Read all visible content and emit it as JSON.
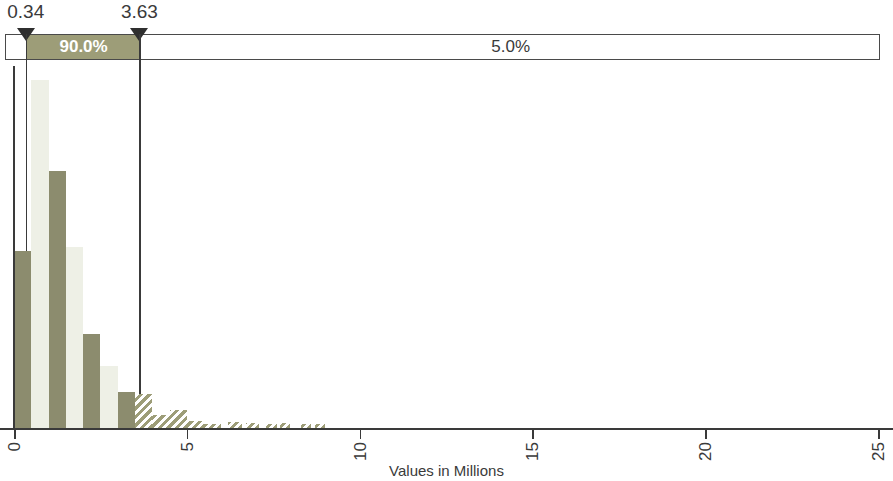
{
  "chart_data": {
    "type": "bar",
    "title": "",
    "subtitle": "",
    "xlabel": "Values in Millions",
    "ylabel": "",
    "xlim": [
      0,
      25
    ],
    "xticks": [
      0,
      5,
      10,
      15,
      20,
      25
    ],
    "xtick_labels": [
      "0",
      "5",
      "10",
      "15",
      "20",
      "25"
    ],
    "ylim": [
      0,
      1.0
    ],
    "grid": false,
    "legend": "none",
    "bin_width": 0.5,
    "bars": [
      {
        "x0": 0.0,
        "x1": 0.5,
        "height": 0.49,
        "shade": "dark"
      },
      {
        "x0": 0.5,
        "x1": 1.0,
        "height": 0.96,
        "shade": "light"
      },
      {
        "x0": 1.0,
        "x1": 1.5,
        "height": 0.71,
        "shade": "dark"
      },
      {
        "x0": 1.5,
        "x1": 2.0,
        "height": 0.5,
        "shade": "light"
      },
      {
        "x0": 2.0,
        "x1": 2.5,
        "height": 0.26,
        "shade": "dark"
      },
      {
        "x0": 2.5,
        "x1": 3.0,
        "height": 0.17,
        "shade": "light"
      },
      {
        "x0": 3.0,
        "x1": 3.5,
        "height": 0.1,
        "shade": "dark"
      },
      {
        "x0": 3.5,
        "x1": 4.0,
        "height": 0.095,
        "shade": "hatch"
      },
      {
        "x0": 4.0,
        "x1": 4.5,
        "height": 0.035,
        "shade": "hatch"
      },
      {
        "x0": 4.5,
        "x1": 5.0,
        "height": 0.05,
        "shade": "hatch"
      },
      {
        "x0": 5.0,
        "x1": 5.5,
        "height": 0.018,
        "shade": "hatch"
      },
      {
        "x0": 5.5,
        "x1": 6.0,
        "height": 0.012,
        "shade": "hatch"
      },
      {
        "x0": 6.2,
        "x1": 6.6,
        "height": 0.016,
        "shade": "hatch"
      },
      {
        "x0": 6.7,
        "x1": 7.1,
        "height": 0.014,
        "shade": "hatch"
      },
      {
        "x0": 7.3,
        "x1": 7.6,
        "height": 0.012,
        "shade": "hatch"
      },
      {
        "x0": 7.7,
        "x1": 8.0,
        "height": 0.014,
        "shade": "hatch"
      },
      {
        "x0": 8.3,
        "x1": 8.6,
        "height": 0.012,
        "shade": "hatch"
      },
      {
        "x0": 8.7,
        "x1": 9.0,
        "height": 0.012,
        "shade": "hatch"
      }
    ],
    "colors": {
      "bar_dark": "#8c8c6e",
      "bar_light": "#eef0e6",
      "band_fill": "#9d9d78",
      "axis": "#3a3a3a"
    },
    "percentile_band": {
      "lower_marker_value": "0.34",
      "upper_marker_value": "3.63",
      "lower_marker_x": 0.34,
      "upper_marker_x": 3.63,
      "segments": [
        {
          "name": "left",
          "label": "",
          "from": 0.0,
          "to": 0.34
        },
        {
          "name": "mid",
          "label": "90.0%",
          "from": 0.34,
          "to": 3.63
        },
        {
          "name": "right",
          "label": "5.0%",
          "from": 3.63,
          "to": 25.0
        }
      ]
    }
  }
}
